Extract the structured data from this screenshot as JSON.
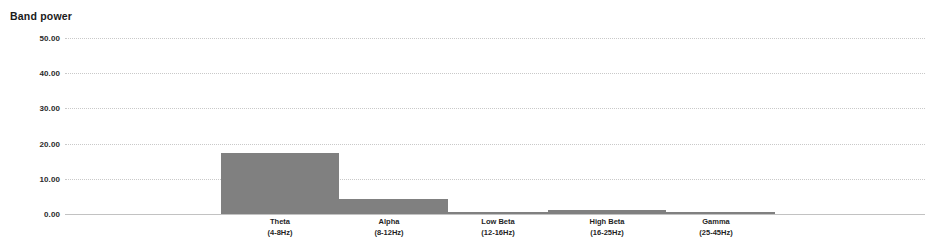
{
  "chart_data": {
    "type": "bar",
    "title": "Band power",
    "xlabel": "",
    "ylabel": "",
    "ylim": [
      0,
      50
    ],
    "grid": true,
    "legend": "none",
    "orientation": "vertical",
    "bar_color": "#808080",
    "background_color": "#ffffff",
    "y_ticks": [
      50,
      40,
      30,
      20,
      10,
      0
    ],
    "y_tick_labels": [
      "50.00",
      "40.00",
      "30.00",
      "20.00",
      "10.00",
      "0.00"
    ],
    "categories": [
      "Theta (4-8Hz)",
      "Alpha (8-12Hz)",
      "Low Beta (12-16Hz)",
      "High Beta (16-25Hz)",
      "Gamma (25-45Hz)"
    ],
    "values": [
      17.2,
      4.4,
      0.5,
      1.2,
      0.4
    ],
    "bands": [
      {
        "name": "Theta",
        "range": "(4-8Hz)",
        "value": 17.2
      },
      {
        "name": "Alpha",
        "range": "(8-12Hz)",
        "value": 4.4
      },
      {
        "name": "Low Beta",
        "range": "(12-16Hz)",
        "value": 0.5
      },
      {
        "name": "High Beta",
        "range": "(16-25Hz)",
        "value": 1.2
      },
      {
        "name": "Gamma",
        "range": "(25-45Hz)",
        "value": 0.4
      }
    ]
  }
}
